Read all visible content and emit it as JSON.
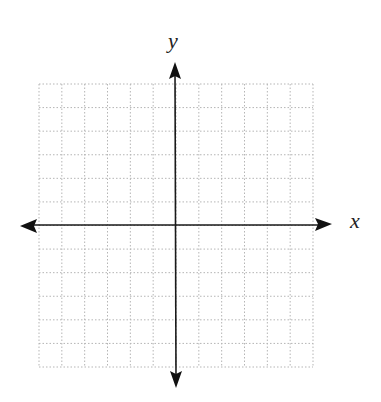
{
  "diagram": {
    "type": "coordinate-plane",
    "grid": {
      "columns": 12,
      "rows": 12,
      "style": "dotted",
      "color": "#b5b5b5"
    },
    "axes": {
      "color": "#1a1a1a",
      "x_label": "x",
      "y_label": "y",
      "arrows": [
        "left",
        "right",
        "up",
        "down"
      ]
    }
  }
}
